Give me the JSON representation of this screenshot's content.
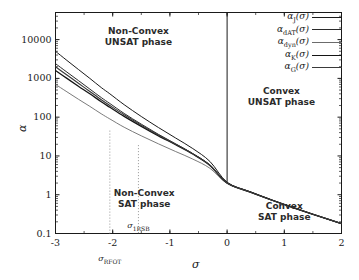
{
  "chart_data": {
    "type": "line",
    "title": "",
    "xlabel": "σ",
    "ylabel": "α",
    "xlim": [
      -3,
      2
    ],
    "ylim": [
      0.1,
      50000
    ],
    "yscale": "log",
    "xscale": "linear",
    "grid": false,
    "legend_position": "top-right",
    "xticks": [
      "-3",
      "-2",
      "-1",
      "0",
      "1",
      "2"
    ],
    "xtick_values": [
      -3,
      -2,
      -1,
      0,
      1,
      2
    ],
    "yticks": [
      "0.1",
      "1",
      "10",
      "100",
      "1000",
      "10000"
    ],
    "ytick_values": [
      0.1,
      1,
      10,
      100,
      1000,
      10000
    ],
    "series": [
      {
        "name": "α_J(σ)",
        "legend_label_main": "α",
        "legend_label_sub": "J",
        "legend_label_suffix": "(σ)",
        "color": "#1a1a1a",
        "width": 1.0,
        "x": [
          -3.0,
          -2.8,
          -2.6,
          -2.4,
          -2.2,
          -2.05,
          -1.8,
          -1.5,
          -1.2,
          -0.9,
          -0.6,
          -0.3,
          0.0,
          0.4,
          0.8,
          1.2,
          1.6,
          2.0
        ],
        "y": [
          5000,
          2900,
          1700,
          1000,
          580,
          400,
          210,
          104,
          54,
          29,
          15.5,
          7.2,
          2.1,
          1.2,
          0.72,
          0.45,
          0.28,
          0.18
        ]
      },
      {
        "name": "α_dAT(σ)",
        "legend_label_main": "α",
        "legend_label_sub": "dAT",
        "legend_label_suffix": "(σ)",
        "color": "#2a2a2a",
        "width": 1.0,
        "x": [
          -3.0,
          -2.8,
          -2.6,
          -2.4,
          -2.2,
          -2.05,
          -1.8,
          -1.5,
          -1.2,
          -0.9,
          -0.6,
          -0.3,
          0.0,
          0.4,
          0.8,
          1.2,
          1.6,
          2.0
        ],
        "y": [
          2400,
          1450,
          880,
          530,
          320,
          225,
          125,
          66,
          36,
          20.5,
          11.5,
          5.8,
          2.0,
          1.18,
          0.71,
          0.44,
          0.28,
          0.18
        ]
      },
      {
        "name": "α_dyn(σ)",
        "legend_label_main": "α",
        "legend_label_sub": "dyn",
        "legend_label_suffix": "(σ)",
        "color": "#6b6b6b",
        "width": 0.9,
        "x": [
          -3.0,
          -2.8,
          -2.6,
          -2.4,
          -2.2,
          -2.05,
          -1.8,
          -1.5,
          -1.2,
          -0.9,
          -0.6,
          -0.3,
          0.0,
          0.4,
          0.8,
          1.2,
          1.6,
          2.0
        ],
        "y": [
          700,
          450,
          290,
          190,
          122,
          90,
          55,
          33,
          20.5,
          13.0,
          8.3,
          4.8,
          1.95,
          1.15,
          0.7,
          0.44,
          0.28,
          0.18
        ]
      },
      {
        "name": "α_K(σ)",
        "legend_label_main": "α",
        "legend_label_sub": "K",
        "legend_label_suffix": "(σ)",
        "color": "#141414",
        "width": 1.3,
        "x": [
          -3.0,
          -2.8,
          -2.6,
          -2.4,
          -2.2,
          -2.05,
          -1.8,
          -1.5,
          -1.2,
          -0.9,
          -0.6,
          -0.3,
          0.0,
          0.4,
          0.8,
          1.2,
          1.6,
          2.0
        ],
        "y": [
          1600,
          1000,
          630,
          400,
          250,
          180,
          105,
          58,
          33,
          19.5,
          11.2,
          5.7,
          2.0,
          1.18,
          0.71,
          0.44,
          0.28,
          0.18
        ]
      },
      {
        "name": "α_G(σ)",
        "legend_label_main": "α",
        "legend_label_sub": "G",
        "legend_label_suffix": "(σ)",
        "color": "#3a3a3a",
        "width": 1.15,
        "x": [
          -3.0,
          -2.8,
          -2.6,
          -2.4,
          -2.2,
          -2.05,
          -1.8,
          -1.5,
          -1.2,
          -0.9,
          -0.6,
          -0.3,
          0.0,
          0.4,
          0.8,
          1.2,
          1.6,
          2.0
        ],
        "y": [
          2000,
          1220,
          750,
          460,
          282,
          200,
          115,
          62,
          34.5,
          20.0,
          11.3,
          5.75,
          2.0,
          1.18,
          0.71,
          0.44,
          0.28,
          0.18
        ]
      }
    ],
    "vertical_markers": [
      {
        "name": "sigma-rfot-dropline",
        "x": -2.05,
        "y_top": 45,
        "y_bottom": 0.1,
        "style": "dotted",
        "color": "#8a8a8a"
      },
      {
        "name": "sigma-1rsb-dropline",
        "x": -1.55,
        "y_top": 19,
        "y_bottom": 0.1,
        "style": "dotted",
        "color": "#8a8a8a"
      },
      {
        "name": "convexity-boundary",
        "x": 0.0,
        "y_top": 50000,
        "y_bottom": 2.05,
        "style": "solid",
        "color": "#1a1a1a"
      }
    ],
    "annotations": [
      {
        "name": "sigma-rfot-label",
        "text_main": "σ",
        "text_sub": "RFOT",
        "x": -2.05,
        "position": "below-axis"
      },
      {
        "name": "sigma-1rsb-label",
        "text_main": "σ",
        "text_sub": "1RSB",
        "x": -1.55,
        "position": "above-axis"
      }
    ],
    "phase_regions": [
      {
        "name": "non-convex-unsat",
        "line1": "Non-Convex",
        "line2": "UNSAT phase",
        "x": -1.55,
        "y": 12000
      },
      {
        "name": "convex-unsat",
        "line1": "Convex",
        "line2": "UNSAT phase",
        "x": 0.95,
        "y": 330
      },
      {
        "name": "non-convex-sat",
        "line1": "Non-Convex",
        "line2": "SAT phase",
        "x": -1.45,
        "y": 0.78
      },
      {
        "name": "convex-sat",
        "line1": "Convex",
        "line2": "SAT phase",
        "x": 1.0,
        "y": 0.36
      }
    ]
  },
  "axis": {
    "x_title": "σ",
    "y_title": "α"
  }
}
